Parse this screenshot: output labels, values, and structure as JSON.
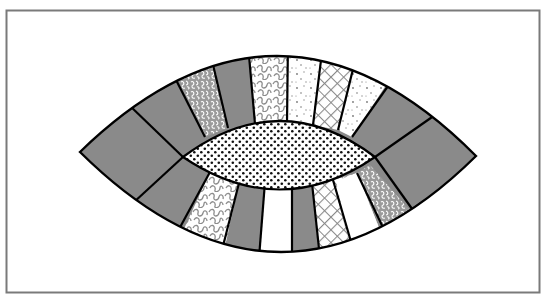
{
  "colors": {
    "frame": "#7a7a7a",
    "outline": "#000000",
    "solid_gray": "#8a8a8a",
    "pattern_gray": "#8c8c8c",
    "white": "#ffffff"
  },
  "top_arc": {
    "patches": [
      {
        "fabric": "solid-gray"
      },
      {
        "fabric": "solid-gray"
      },
      {
        "fabric": "dense-squiggle"
      },
      {
        "fabric": "solid-gray"
      },
      {
        "fabric": "loop-squiggle"
      },
      {
        "fabric": "speckle"
      },
      {
        "fabric": "crosshatch"
      },
      {
        "fabric": "speckle"
      },
      {
        "fabric": "solid-gray"
      },
      {
        "fabric": "solid-gray"
      }
    ]
  },
  "bottom_arc": {
    "patches": [
      {
        "fabric": "solid-gray"
      },
      {
        "fabric": "solid-gray"
      },
      {
        "fabric": "loop-squiggle"
      },
      {
        "fabric": "solid-gray"
      },
      {
        "fabric": "white"
      },
      {
        "fabric": "solid-gray"
      },
      {
        "fabric": "crosshatch"
      },
      {
        "fabric": "white"
      },
      {
        "fabric": "dense-squiggle"
      },
      {
        "fabric": "solid-gray"
      }
    ]
  },
  "center": {
    "fabric": "polka-dot"
  }
}
